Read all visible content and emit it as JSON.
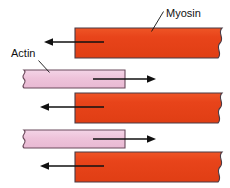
{
  "figure": {
    "background_color": "#ffffff"
  },
  "labels": [
    {
      "id": "myosin",
      "text": "Myosin",
      "x": 166,
      "y": 17,
      "anchor": "start",
      "leader": "M163.5,11.5 L151.5,31.5"
    },
    {
      "id": "actin",
      "text": "Actin",
      "x": 11,
      "y": 57,
      "anchor": "start",
      "leader": "M38.5,60.5 L49.5,72.5"
    }
  ],
  "colors": {
    "myosin_fill": "#e8441a",
    "myosin_fill_dark": "#d63c14",
    "myosin_stroke": "#5a3430",
    "actin_fill": "#eec3da",
    "actin_fill_light": "#f3d4e4",
    "actin_stroke": "#6b4a5c",
    "arrow": "#111111",
    "text": "#111111",
    "background": "#ffffff"
  },
  "filaments": [
    {
      "id": "myosin-1",
      "type": "myosin",
      "row": 1,
      "x": 75,
      "y": 28,
      "width": 147,
      "height": 30,
      "torn_edge": "right"
    },
    {
      "id": "actin-1",
      "type": "actin",
      "row": 2,
      "x": 19,
      "y": 70,
      "width": 106,
      "height": 18,
      "torn_edge": "left"
    },
    {
      "id": "myosin-2",
      "type": "myosin",
      "row": 3,
      "x": 75,
      "y": 93,
      "width": 147,
      "height": 30,
      "torn_edge": "right"
    },
    {
      "id": "actin-2",
      "type": "actin",
      "row": 4,
      "x": 19,
      "y": 130,
      "width": 106,
      "height": 18,
      "torn_edge": "left"
    },
    {
      "id": "myosin-3",
      "type": "myosin",
      "row": 5,
      "x": 75,
      "y": 152,
      "width": 147,
      "height": 30,
      "torn_edge": "right"
    }
  ],
  "arrows": [
    {
      "id": "arrow-myosin-1",
      "direction": "left",
      "tail_x": 104,
      "tip_x": 44,
      "y": 42,
      "description": "Myosin filament moves left"
    },
    {
      "id": "arrow-actin-1",
      "direction": "right",
      "tail_x": 93,
      "tip_x": 156,
      "y": 79,
      "description": "Actin filament moves right"
    },
    {
      "id": "arrow-myosin-2",
      "direction": "left",
      "tail_x": 104,
      "tip_x": 40,
      "y": 107,
      "description": "Myosin filament moves left"
    },
    {
      "id": "arrow-actin-2",
      "direction": "right",
      "tail_x": 93,
      "tip_x": 156,
      "y": 139,
      "description": "Actin filament moves right"
    },
    {
      "id": "arrow-myosin-3",
      "direction": "left",
      "tail_x": 104,
      "tip_x": 40,
      "y": 166,
      "description": "Myosin filament moves left"
    }
  ]
}
